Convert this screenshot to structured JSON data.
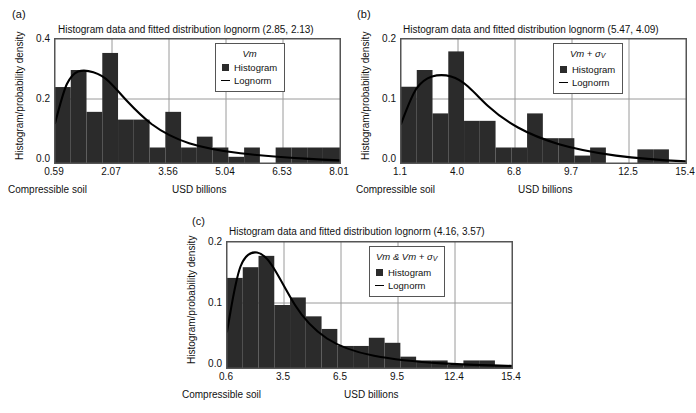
{
  "figure": {
    "xlabel": "USD billions",
    "ylabel": "Histogram/probability density",
    "corner_note": "Compressible soil",
    "legend_histogram": "Histogram",
    "legend_lognorm": "Lognorm",
    "colors": {
      "bar": "#2b2b2b",
      "curve": "#000000",
      "grid": "#9a9a9a",
      "frame": "#555555",
      "background": "#ffffff"
    }
  },
  "panels": [
    {
      "letter": "(a)",
      "title": "Histogram data and fitted distribution lognorm (2.85, 2.13)",
      "legend_title": "Vm",
      "chart_data": {
        "type": "bar",
        "title": "Histogram data and fitted distribution lognorm (2.85, 2.13)",
        "xlabel": "USD billions",
        "ylabel": "Histogram/probability density",
        "xlim": [
          0.59,
          8.01
        ],
        "ylim": [
          0.0,
          0.4
        ],
        "xticks": [
          "0.59",
          "2.07",
          "3.56",
          "5.04",
          "6.53",
          "8.01"
        ],
        "xtick_values": [
          0.59,
          2.07,
          3.56,
          5.04,
          6.53,
          8.01
        ],
        "yticks": [
          "0.0",
          "0.2",
          "0.4"
        ],
        "ytick_values": [
          0.0,
          0.2,
          0.4
        ],
        "grid": true,
        "legend_position": "top-right",
        "bin_edges": [
          0.59,
          1.0,
          1.42,
          1.83,
          2.24,
          2.66,
          3.07,
          3.48,
          3.9,
          4.31,
          4.73,
          5.14,
          5.55,
          5.97,
          6.38,
          6.79,
          7.21,
          7.62,
          8.01
        ],
        "bar_values": [
          0.245,
          0.3,
          0.165,
          0.355,
          0.14,
          0.14,
          0.05,
          0.165,
          0.05,
          0.085,
          0.05,
          0.02,
          0.05,
          0.0,
          0.05,
          0.05,
          0.05,
          0.05
        ],
        "series": [
          {
            "name": "Histogram",
            "type": "bar",
            "values": [
              0.245,
              0.3,
              0.165,
              0.355,
              0.14,
              0.14,
              0.05,
              0.165,
              0.05,
              0.085,
              0.05,
              0.02,
              0.05,
              0.0,
              0.05,
              0.05,
              0.05,
              0.05
            ]
          },
          {
            "name": "Lognorm",
            "type": "line",
            "distribution": "lognormal",
            "params": {
              "mean": 2.85,
              "std": 2.13
            },
            "x": [
              0.59,
              0.9,
              1.2,
              1.5,
              1.8,
              2.1,
              2.4,
              2.8,
              3.2,
              3.6,
              4.0,
              4.5,
              5.0,
              5.5,
              6.0,
              6.5,
              7.0,
              7.5,
              8.01
            ],
            "y": [
              0.128,
              0.242,
              0.283,
              0.292,
              0.286,
              0.272,
              0.255,
              0.229,
              0.203,
              0.178,
              0.156,
              0.131,
              0.11,
              0.092,
              0.077,
              0.065,
              0.055,
              0.047,
              0.04
            ]
          }
        ]
      }
    },
    {
      "letter": "(b)",
      "title": "Histogram data and fitted distribution lognorm (5.47, 4.09)",
      "legend_title": "Vm + σV",
      "chart_data": {
        "type": "bar",
        "title": "Histogram data and fitted distribution lognorm (5.47, 4.09)",
        "xlabel": "USD billions",
        "ylabel": "Histogram/probability density",
        "xlim": [
          1.1,
          15.4
        ],
        "ylim": [
          0.0,
          0.2
        ],
        "xticks": [
          "1.1",
          "4.0",
          "6.8",
          "9.7",
          "12.5",
          "15.4"
        ],
        "xtick_values": [
          1.1,
          4.0,
          6.8,
          9.7,
          12.5,
          15.4
        ],
        "yticks": [
          "0.0",
          "0.1",
          "0.2"
        ],
        "ytick_values": [
          0.0,
          0.1,
          0.2
        ],
        "grid": true,
        "legend_position": "top-right",
        "bin_edges": [
          1.1,
          1.89,
          2.69,
          3.48,
          4.28,
          5.07,
          5.87,
          6.66,
          7.46,
          8.25,
          9.05,
          9.84,
          10.64,
          11.43,
          12.23,
          13.02,
          13.82,
          14.61,
          15.4
        ],
        "bar_values": [
          0.123,
          0.15,
          0.08,
          0.18,
          0.068,
          0.068,
          0.025,
          0.025,
          0.08,
          0.04,
          0.04,
          0.012,
          0.025,
          0.0,
          0.0,
          0.022,
          0.022,
          0.0
        ],
        "series": [
          {
            "name": "Histogram",
            "type": "bar",
            "values": [
              0.123,
              0.15,
              0.08,
              0.18,
              0.068,
              0.068,
              0.025,
              0.025,
              0.08,
              0.04,
              0.04,
              0.012,
              0.025,
              0.0,
              0.0,
              0.022,
              0.022,
              0.0
            ]
          },
          {
            "name": "Lognorm",
            "type": "line",
            "distribution": "lognormal",
            "params": {
              "mean": 5.47,
              "std": 4.09
            },
            "x": [
              1.1,
              1.7,
              2.3,
              2.9,
              3.5,
              4.1,
              4.7,
              5.5,
              6.3,
              7.1,
              8.0,
              9.0,
              10.0,
              11.0,
              12.0,
              13.0,
              14.0,
              15.4
            ],
            "y": [
              0.063,
              0.118,
              0.141,
              0.149,
              0.149,
              0.144,
              0.136,
              0.123,
              0.109,
              0.096,
              0.083,
              0.07,
              0.059,
              0.05,
              0.042,
              0.036,
              0.031,
              0.024
            ]
          }
        ]
      }
    },
    {
      "letter": "(c)",
      "title": "Histogram data and fitted distribution lognorm (4.16, 3.57)",
      "legend_title": "Vm & Vm + σV",
      "chart_data": {
        "type": "bar",
        "title": "Histogram data and fitted distribution lognorm (4.16, 3.57)",
        "xlabel": "USD billions",
        "ylabel": "Histogram/probability density",
        "xlim": [
          0.6,
          15.4
        ],
        "ylim": [
          0.0,
          0.2
        ],
        "xticks": [
          "0.6",
          "3.5",
          "6.5",
          "9.5",
          "12.4",
          "15.4"
        ],
        "xtick_values": [
          0.6,
          3.5,
          6.5,
          9.5,
          12.4,
          15.4
        ],
        "yticks": [
          "0.0",
          "0.1",
          "0.2"
        ],
        "ytick_values": [
          0.0,
          0.1,
          0.2
        ],
        "grid": true,
        "legend_position": "top-right",
        "bin_edges": [
          0.6,
          1.42,
          2.24,
          3.07,
          3.89,
          4.71,
          5.53,
          6.36,
          7.18,
          8.0,
          8.82,
          9.64,
          10.47,
          11.29,
          12.11,
          12.93,
          13.76,
          14.58,
          15.4
        ],
        "bar_values": [
          0.143,
          0.16,
          0.178,
          0.1,
          0.112,
          0.082,
          0.062,
          0.035,
          0.035,
          0.048,
          0.04,
          0.018,
          0.012,
          0.012,
          0.005,
          0.012,
          0.012,
          0.005
        ],
        "series": [
          {
            "name": "Histogram",
            "type": "bar",
            "values": [
              0.143,
              0.16,
              0.178,
              0.1,
              0.112,
              0.082,
              0.062,
              0.035,
              0.035,
              0.048,
              0.04,
              0.018,
              0.012,
              0.012,
              0.005,
              0.012,
              0.012,
              0.005
            ]
          },
          {
            "name": "Lognorm",
            "type": "line",
            "distribution": "lognormal",
            "params": {
              "mean": 4.16,
              "std": 3.57
            },
            "x": [
              0.6,
              1.0,
              1.4,
              1.8,
              2.2,
              2.6,
              3.0,
              3.6,
              4.2,
              5.0,
              5.8,
              6.6,
              7.5,
              8.5,
              9.5,
              10.5,
              12.0,
              13.5,
              15.4
            ],
            "y": [
              0.058,
              0.145,
              0.174,
              0.177,
              0.17,
              0.158,
              0.145,
              0.126,
              0.108,
              0.088,
              0.072,
              0.06,
              0.049,
              0.039,
              0.032,
              0.026,
              0.019,
              0.014,
              0.009
            ]
          }
        ]
      }
    }
  ]
}
